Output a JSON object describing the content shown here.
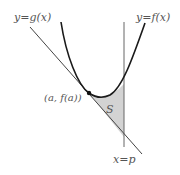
{
  "labels": {
    "g_curve": "y=g(x)",
    "f_curve": "y=f(x)",
    "tangent_point": "(a, f(a))",
    "region": "S",
    "vertical_line": "x=p"
  },
  "colors": {
    "curve": "#222222",
    "line": "#555555",
    "shade": "#d0d0d0",
    "text": "#555555"
  }
}
